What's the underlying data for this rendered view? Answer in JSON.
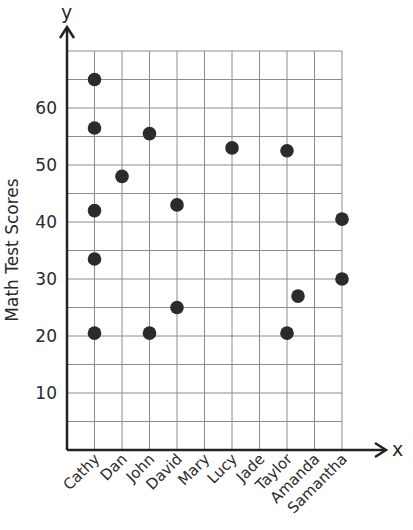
{
  "chart_data": {
    "type": "scatter",
    "title": "",
    "xlabel": "x",
    "ylabel": "Math Test Scores",
    "y_axis_letter": "y",
    "x_axis_letter": "x",
    "categories": [
      "Cathy",
      "Dan",
      "John",
      "David",
      "Mary",
      "Lucy",
      "Jade",
      "Taylor",
      "Amanda",
      "Samantha"
    ],
    "ylim": [
      0,
      70
    ],
    "y_ticks": [
      10,
      20,
      30,
      40,
      50,
      60
    ],
    "y_grid_step": 5,
    "grid": true,
    "legend": null,
    "points": [
      {
        "category": "Cathy",
        "x_index": 0,
        "y": 65
      },
      {
        "category": "Cathy",
        "x_index": 0,
        "y": 56.5
      },
      {
        "category": "Cathy",
        "x_index": 0,
        "y": 42
      },
      {
        "category": "Cathy",
        "x_index": 0,
        "y": 33.5
      },
      {
        "category": "Cathy",
        "x_index": 0,
        "y": 20.5
      },
      {
        "category": "Dan",
        "x_index": 1,
        "y": 48
      },
      {
        "category": "John",
        "x_index": 2,
        "y": 55.5
      },
      {
        "category": "John",
        "x_index": 2,
        "y": 20.5
      },
      {
        "category": "David",
        "x_index": 3,
        "y": 43
      },
      {
        "category": "David",
        "x_index": 3,
        "y": 25
      },
      {
        "category": "Lucy",
        "x_index": 5,
        "y": 53
      },
      {
        "category": "Taylor",
        "x_index": 7,
        "y": 52.5
      },
      {
        "category": "Taylor",
        "x_index": 7,
        "y": 20.5
      },
      {
        "category": "Amanda",
        "x_index": 7.4,
        "y": 27
      },
      {
        "category": "Samantha",
        "x_index": 9,
        "y": 40.5
      },
      {
        "category": "Samantha",
        "x_index": 9,
        "y": 30
      }
    ]
  },
  "style": {
    "dot_color": "#2b2b2b",
    "grid_color": "#8c8c8c",
    "axis_color": "#222222"
  }
}
